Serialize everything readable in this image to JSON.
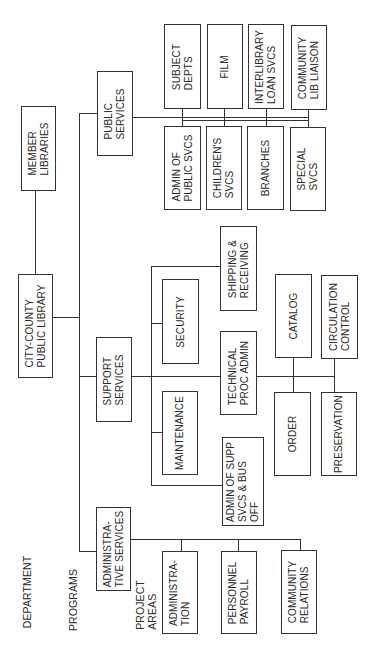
{
  "chart": {
    "orientation": "rotated-90-ccw",
    "level_labels": {
      "department": "DEPARTMENT",
      "programs": "PROGRAMS",
      "project_areas": "PROJECT\nAREAS"
    },
    "root": {
      "label": "CITY-COUNTY\nPUBLIC LIBRARY"
    },
    "affiliate": {
      "label": "MEMBER\nLIBRARIES"
    },
    "programs": {
      "public_services": {
        "label": "PUBLIC\nSERVICES",
        "children": [
          "SUBJECT\nDEPTS",
          "FILM",
          "INTERLIBRARY\nLOAN SVCS",
          "COMMUNITY\nLIB LIAISON",
          "ADMIN OF\nPUBLIC SVCS",
          "CHILDREN'S\nSVCS",
          "BRANCHES",
          "SPECIAL\nSVCS"
        ]
      },
      "support_services": {
        "label": "SUPPORT\nSERVICES",
        "children": [
          "SHIPPING &\nRECEIVING",
          "SECURITY",
          "TECHNICAL\nPROC ADMIN",
          "MAINTENANCE",
          "ADMIN OF SUPP\nSVCS & BUS\nOFF"
        ],
        "technical_children": [
          "CATALOG",
          "CIRCULATION\nCONTROL",
          "ORDER",
          "PRESERVATION"
        ]
      },
      "administrative_services": {
        "label": "ADMINISTRA-\nTIVE SERVICES",
        "children": [
          "ADMINISTRA-\nTION",
          "PERSONNEL\nPAYROLL",
          "COMMUNITY\nRELATIONS"
        ]
      }
    }
  }
}
